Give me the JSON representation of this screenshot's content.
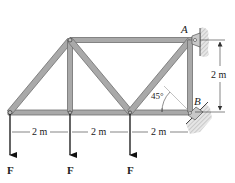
{
  "figure": {
    "type": "truss-diagram",
    "colors": {
      "member_fill": "#a9a9a9",
      "member_edge": "#6e6e6e",
      "line": "#333333",
      "hatch": "#bdbdbd"
    },
    "nodes": [
      {
        "id": "n1",
        "x": 10,
        "y": 112
      },
      {
        "id": "n2",
        "x": 70,
        "y": 112
      },
      {
        "id": "n3",
        "x": 130,
        "y": 112
      },
      {
        "id": "B",
        "x": 190,
        "y": 112,
        "label": "B"
      },
      {
        "id": "n5",
        "x": 70,
        "y": 40
      },
      {
        "id": "A",
        "x": 190,
        "y": 40,
        "label": "A"
      }
    ],
    "members": [
      [
        "n1",
        "n2"
      ],
      [
        "n2",
        "n3"
      ],
      [
        "n3",
        "B"
      ],
      [
        "n5",
        "A"
      ],
      [
        "n1",
        "n5"
      ],
      [
        "n2",
        "n5"
      ],
      [
        "n5",
        "n3"
      ],
      [
        "n3",
        "A"
      ],
      [
        "B",
        "A"
      ]
    ],
    "loads": [
      {
        "node": "n1",
        "label": "F"
      },
      {
        "node": "n2",
        "label": "F"
      },
      {
        "node": "n3",
        "label": "F"
      }
    ],
    "supports": {
      "A": "pin to vertical wall",
      "B": "rocker on 45° incline"
    },
    "labels": {
      "point_a": "A",
      "point_b": "B",
      "angle": "45°",
      "height_dim": "2 m",
      "span_dims": [
        "2 m",
        "2 m",
        "2 m"
      ],
      "forces": [
        "F",
        "F",
        "F"
      ]
    }
  }
}
